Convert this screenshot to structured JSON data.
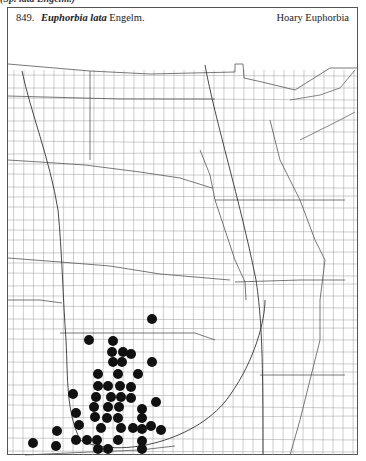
{
  "header": {
    "number": "849.",
    "genus_species": "Euphorbia lata",
    "author": "Engelm.",
    "common_name": "Hoary Euphorbia"
  },
  "top_cutoff_text": "(Sp. lata Engelm.)",
  "map": {
    "region": "Great Plains (North Dakota to Oklahoma)",
    "line_color": "#888888",
    "state_line_color": "#444444",
    "dot_color": "#111111",
    "dot_radius": 5,
    "occurrences": [
      {
        "x": 152,
        "y": 319
      },
      {
        "x": 89,
        "y": 340
      },
      {
        "x": 113,
        "y": 341
      },
      {
        "x": 112,
        "y": 352
      },
      {
        "x": 123,
        "y": 352
      },
      {
        "x": 131,
        "y": 354
      },
      {
        "x": 113,
        "y": 362
      },
      {
        "x": 122,
        "y": 362
      },
      {
        "x": 152,
        "y": 362
      },
      {
        "x": 98,
        "y": 374
      },
      {
        "x": 118,
        "y": 374
      },
      {
        "x": 138,
        "y": 374
      },
      {
        "x": 98,
        "y": 386
      },
      {
        "x": 108,
        "y": 386
      },
      {
        "x": 120,
        "y": 386
      },
      {
        "x": 131,
        "y": 387
      },
      {
        "x": 73,
        "y": 394
      },
      {
        "x": 96,
        "y": 397
      },
      {
        "x": 111,
        "y": 397
      },
      {
        "x": 121,
        "y": 397
      },
      {
        "x": 131,
        "y": 398
      },
      {
        "x": 156,
        "y": 402
      },
      {
        "x": 94,
        "y": 407
      },
      {
        "x": 108,
        "y": 407
      },
      {
        "x": 119,
        "y": 407
      },
      {
        "x": 142,
        "y": 409
      },
      {
        "x": 76,
        "y": 413
      },
      {
        "x": 95,
        "y": 417
      },
      {
        "x": 107,
        "y": 418
      },
      {
        "x": 118,
        "y": 418
      },
      {
        "x": 142,
        "y": 418
      },
      {
        "x": 79,
        "y": 425
      },
      {
        "x": 101,
        "y": 428
      },
      {
        "x": 121,
        "y": 428
      },
      {
        "x": 133,
        "y": 428
      },
      {
        "x": 142,
        "y": 429
      },
      {
        "x": 151,
        "y": 426
      },
      {
        "x": 161,
        "y": 430
      },
      {
        "x": 57,
        "y": 431
      },
      {
        "x": 76,
        "y": 440
      },
      {
        "x": 87,
        "y": 440
      },
      {
        "x": 97,
        "y": 440
      },
      {
        "x": 118,
        "y": 440
      },
      {
        "x": 142,
        "y": 441
      },
      {
        "x": 33,
        "y": 443
      },
      {
        "x": 56,
        "y": 446
      },
      {
        "x": 98,
        "y": 449
      },
      {
        "x": 108,
        "y": 449
      },
      {
        "x": 142,
        "y": 449
      }
    ]
  }
}
